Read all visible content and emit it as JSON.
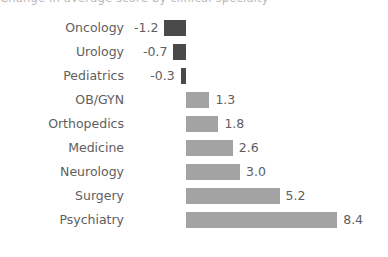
{
  "title_crop": "Change in average score by clinical specialty",
  "colors": {
    "negative_bar": "#4a4a4a",
    "positive_bar": "#a3a3a3",
    "label_text": "#5e5e5e",
    "background": "#ffffff"
  },
  "axis": {
    "zero_x_px": 186,
    "px_per_unit": 18,
    "row_pitch_px": 24,
    "first_row_top_px": 16
  },
  "chart_data": {
    "type": "bar",
    "orientation": "horizontal",
    "title": "Change in average score by clinical specialty",
    "xlabel": "",
    "ylabel": "",
    "grid": false,
    "legend": "none",
    "xlim": [
      -1.6,
      9.2
    ],
    "categories": [
      "Oncology",
      "Urology",
      "Pediatrics",
      "OB/GYN",
      "Orthopedics",
      "Medicine",
      "Neurology",
      "Surgery",
      "Psychiatry"
    ],
    "values": [
      -1.2,
      -0.7,
      -0.3,
      1.3,
      1.8,
      2.6,
      3.0,
      5.2,
      8.4
    ],
    "value_labels": [
      "-1.2",
      "-0.7",
      "-0.3",
      "1.3",
      "1.8",
      "2.6",
      "3.0",
      "5.2",
      "8.4"
    ],
    "bars": [
      {
        "category": "Oncology",
        "value": -1.2,
        "label": "-1.2",
        "sign": "negative"
      },
      {
        "category": "Urology",
        "value": -0.7,
        "label": "-0.7",
        "sign": "negative"
      },
      {
        "category": "Pediatrics",
        "value": -0.3,
        "label": "-0.3",
        "sign": "negative"
      },
      {
        "category": "OB/GYN",
        "value": 1.3,
        "label": "1.3",
        "sign": "positive"
      },
      {
        "category": "Orthopedics",
        "value": 1.8,
        "label": "1.8",
        "sign": "positive"
      },
      {
        "category": "Medicine",
        "value": 2.6,
        "label": "2.6",
        "sign": "positive"
      },
      {
        "category": "Neurology",
        "value": 3.0,
        "label": "3.0",
        "sign": "positive"
      },
      {
        "category": "Surgery",
        "value": 5.2,
        "label": "5.2",
        "sign": "positive"
      },
      {
        "category": "Psychiatry",
        "value": 8.4,
        "label": "8.4",
        "sign": "positive"
      }
    ]
  }
}
